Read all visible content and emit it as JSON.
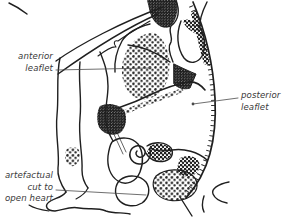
{
  "figure": {
    "type": "anatomical line drawing",
    "colors": {
      "background": "#ffffff",
      "ink": "#1f1f1f",
      "label_text": "#3a3a3a",
      "leader_line": "#4a4a4a"
    },
    "labels": {
      "anterior": {
        "text": "anterior\nleaflet"
      },
      "posterior": {
        "text": "posterior\nleaflet"
      },
      "artefact": {
        "text": "artefactual\ncut to\nopen heart"
      }
    }
  }
}
